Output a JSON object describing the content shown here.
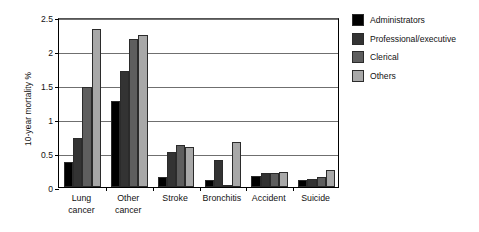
{
  "chart_data": {
    "type": "bar",
    "title": "",
    "xlabel": "",
    "ylabel": "10-year mortality %",
    "ylim": [
      0,
      2.5
    ],
    "ytick_labels": [
      "0",
      "0.5",
      "1",
      "1.5",
      "2",
      "2.5"
    ],
    "ytick_values": [
      0,
      0.5,
      1,
      1.5,
      2,
      2.5
    ],
    "grid": true,
    "legend_position": "right",
    "categories": [
      "Lung\ncancer",
      "Other\ncancer",
      "Stroke",
      "Bronchitis",
      "Accident",
      "Suicide"
    ],
    "series": [
      {
        "name": "Administrators",
        "color": "#000000",
        "values": [
          0.37,
          1.26,
          0.15,
          0.1,
          0.16,
          0.1
        ]
      },
      {
        "name": "Professional/executive",
        "color": "#333333",
        "values": [
          0.72,
          1.7,
          0.52,
          0.4,
          0.2,
          0.12
        ]
      },
      {
        "name": "Clerical",
        "color": "#5e5e5e",
        "values": [
          1.47,
          2.17,
          0.62,
          0.02,
          0.21,
          0.14
        ]
      },
      {
        "name": "Others",
        "color": "#a8a8a8",
        "values": [
          2.33,
          2.23,
          0.59,
          0.66,
          0.22,
          0.25
        ]
      }
    ]
  },
  "axis": {
    "y_title": "10-year mortality %"
  },
  "legend": {
    "items": [
      {
        "label": "Administrators",
        "color": "#000000"
      },
      {
        "label": "Professional/executive",
        "color": "#333333"
      },
      {
        "label": "Clerical",
        "color": "#5e5e5e"
      },
      {
        "label": "Others",
        "color": "#a8a8a8"
      }
    ]
  }
}
